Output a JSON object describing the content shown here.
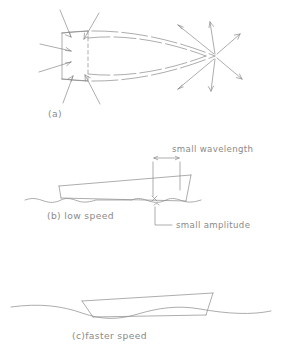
{
  "figure": {
    "title_alt": "Wave pattern generated by a hull at low and faster speed",
    "stroke_color": "#8a8a8a",
    "text_color": "#8a8a8a",
    "background": "#ffffff"
  },
  "panels": [
    {
      "id": "a",
      "label": "(a)",
      "description": "plan view of hull with converging arrows at stern and diverging arrows at bow",
      "arrows_in": 6,
      "arrows_out": 6
    },
    {
      "id": "b",
      "label": "(b) low speed",
      "description": "profile of hull on short-wavelength water surface",
      "annotations": [
        {
          "name": "wavelength",
          "text": "small  wavelength"
        },
        {
          "name": "amplitude",
          "text": "small  amplitude"
        }
      ]
    },
    {
      "id": "c",
      "label": "(c)faster speed",
      "description": "profile of hull on long-wavelength water surface",
      "annotations": []
    }
  ]
}
